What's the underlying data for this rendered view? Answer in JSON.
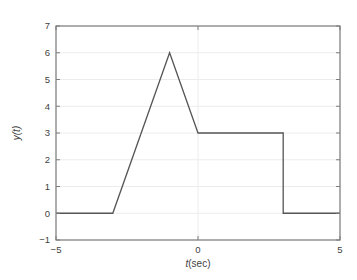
{
  "figure": {
    "background": "#ffffff"
  },
  "chart_data": {
    "type": "line",
    "title": "",
    "xlabel": "t(sec)",
    "ylabel": "y(t)",
    "series": [
      {
        "name": "y(t)",
        "x": [
          -5,
          -3,
          -1,
          0,
          3,
          3,
          5
        ],
        "y": [
          0,
          0,
          6,
          3,
          3,
          0,
          0
        ]
      }
    ],
    "xlim": [
      -5,
      5
    ],
    "ylim": [
      -1,
      7
    ],
    "xticks": [
      -5,
      0,
      5
    ],
    "yticks": [
      -1,
      0,
      1,
      2,
      3,
      4,
      5,
      6,
      7
    ],
    "grid": true,
    "legend": "none",
    "colors": {
      "line": "#555555",
      "axis": "#7d7d7d",
      "grid": "#ececec",
      "tick_text": "#3f3f3f",
      "label_text": "#3f3f3f"
    }
  },
  "labels": {
    "ylabel": "y(t)",
    "xlabel_italic": "t",
    "xlabel_rest": "(sec)"
  }
}
